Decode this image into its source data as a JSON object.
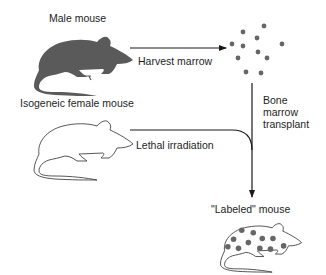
{
  "labels": {
    "male_mouse": "Male mouse",
    "harvest_marrow": "Harvest marrow",
    "female_mouse": "Isogeneic female mouse",
    "lethal_irradiation": "Lethal irradiation",
    "bone_marrow_transplant": [
      "Bone",
      "marrow",
      "transplant"
    ],
    "labeled_mouse": "\"Labeled\" mouse"
  },
  "colors": {
    "mouse_fill": "#5a5a5a",
    "dot_fill": "#666666",
    "line": "#1a1a1a",
    "outline": "#444444"
  }
}
